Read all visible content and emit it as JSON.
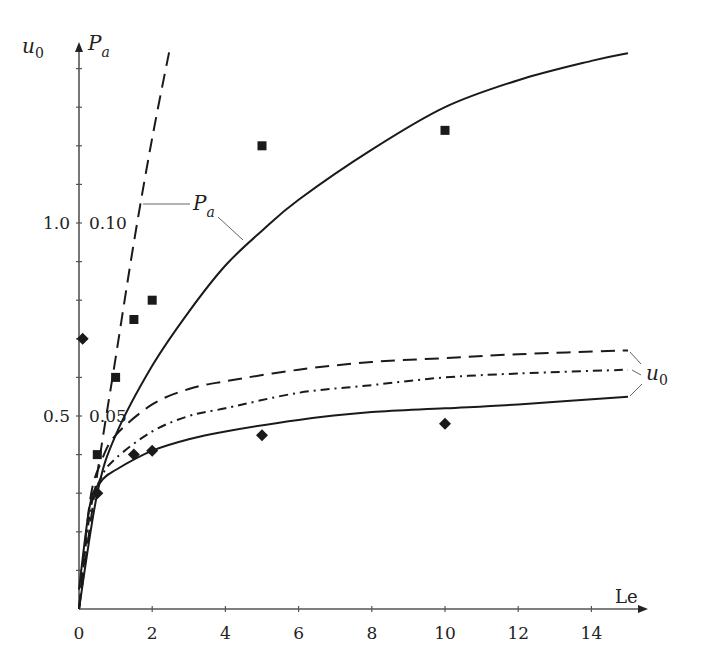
{
  "chart_data": {
    "type": "line",
    "title": "",
    "xlabel": "Le",
    "ylabel_left": "u0",
    "ylabel_right": "Pa",
    "x_ticks": [
      0,
      2,
      4,
      6,
      8,
      10,
      12,
      14
    ],
    "y_ticks_u0": [
      {
        "value": 0.5,
        "label": "0.5"
      },
      {
        "value": 1.0,
        "label": "1.0"
      }
    ],
    "y_ticks_Pa": [
      {
        "value": 0.05,
        "label": "0.05"
      },
      {
        "value": 0.1,
        "label": "0.10"
      }
    ],
    "xlim": [
      0,
      15.8
    ],
    "ylim_u0": [
      0,
      1.45
    ],
    "ylim_Pa": [
      0,
      0.145
    ],
    "grid": false,
    "legend": "inline annotations",
    "series": [
      {
        "name": "Pa (dashed)",
        "axis": "Pa",
        "style": "dashed",
        "x": [
          0,
          0.5,
          1.0,
          1.5,
          2.0,
          2.5
        ],
        "values": [
          0.0,
          0.035,
          0.065,
          0.095,
          0.122,
          0.146
        ]
      },
      {
        "name": "Pa (solid)",
        "axis": "Pa",
        "style": "solid",
        "x": [
          0,
          0.5,
          1,
          2,
          3,
          4,
          5,
          6,
          8,
          10,
          12,
          14,
          15
        ],
        "values": [
          0.0,
          0.03,
          0.045,
          0.063,
          0.077,
          0.089,
          0.098,
          0.106,
          0.119,
          0.13,
          0.137,
          0.142,
          0.144
        ]
      },
      {
        "name": "u0 (dashed)",
        "axis": "u0",
        "style": "dashed",
        "x": [
          0,
          0.3,
          0.6,
          1,
          2,
          3,
          4,
          6,
          8,
          10,
          12,
          15
        ],
        "values": [
          0.0,
          0.28,
          0.38,
          0.45,
          0.53,
          0.57,
          0.59,
          0.62,
          0.64,
          0.65,
          0.66,
          0.67
        ]
      },
      {
        "name": "u0 (dash-dot)",
        "axis": "u0",
        "style": "dash-dot",
        "x": [
          0,
          0.3,
          0.6,
          1,
          2,
          3,
          4,
          6,
          8,
          10,
          12,
          15
        ],
        "values": [
          0.0,
          0.25,
          0.34,
          0.39,
          0.46,
          0.5,
          0.52,
          0.56,
          0.58,
          0.6,
          0.61,
          0.62
        ]
      },
      {
        "name": "u0 (solid)",
        "axis": "u0",
        "style": "solid",
        "x": [
          0,
          0.3,
          0.6,
          1,
          2,
          3,
          4,
          6,
          8,
          10,
          12,
          15
        ],
        "values": [
          0.05,
          0.27,
          0.33,
          0.36,
          0.41,
          0.44,
          0.46,
          0.49,
          0.51,
          0.52,
          0.53,
          0.55
        ]
      },
      {
        "name": "Pa experimental (squares)",
        "axis": "Pa",
        "style": "marker-square",
        "x": [
          0.5,
          1.0,
          1.5,
          2.0,
          5.0,
          10.0
        ],
        "values": [
          0.04,
          0.06,
          0.075,
          0.08,
          0.12,
          0.124
        ]
      },
      {
        "name": "u0 experimental (diamonds)",
        "axis": "u0",
        "style": "marker-diamond",
        "x": [
          0.1,
          0.5,
          1.5,
          2.0,
          5.0,
          10.0
        ],
        "values": [
          0.7,
          0.3,
          0.4,
          0.41,
          0.45,
          0.48
        ]
      }
    ],
    "annotations": [
      {
        "text": "Pa",
        "points_to": [
          "Pa (dashed)",
          "Pa (solid)"
        ]
      },
      {
        "text": "u0",
        "points_to": [
          "u0 (dashed)",
          "u0 (dash-dot)",
          "u0 (solid)"
        ]
      }
    ]
  },
  "labels": {
    "y_left_base": "u",
    "y_left_sub": "0",
    "y_right_base": "P",
    "y_right_sub": "a",
    "x_axis": "Le",
    "pa_annotation_base": "P",
    "pa_annotation_sub": "a",
    "u0_annotation_base": "u",
    "u0_annotation_sub": "0"
  },
  "style": {
    "line_color": "#1a1a1a",
    "axis_color": "#555555"
  }
}
